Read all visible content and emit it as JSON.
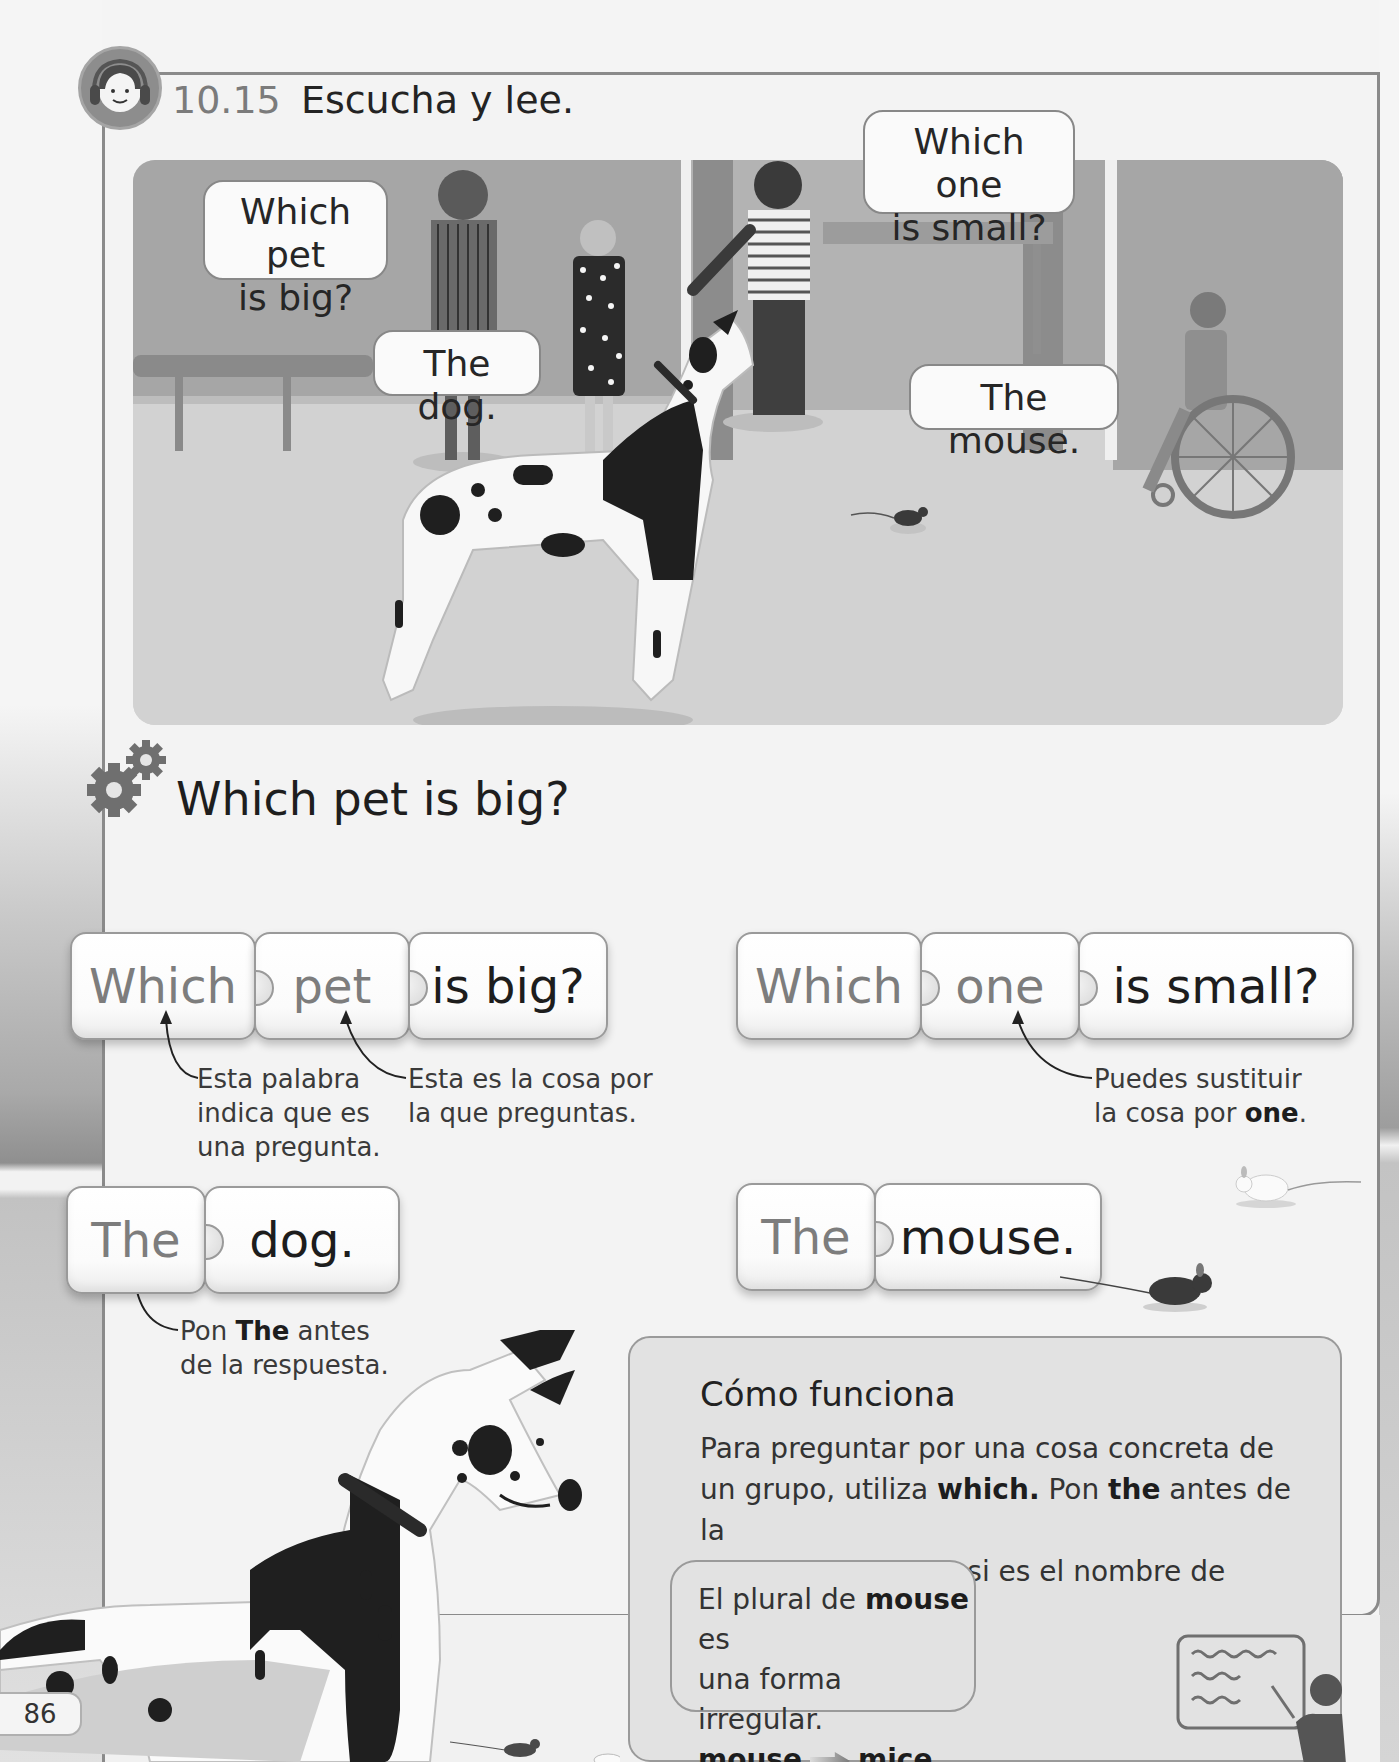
{
  "header": {
    "exercise_number": "10.15",
    "exercise_instruction": "Escucha y lee.",
    "icon": "headphones-icon"
  },
  "scene": {
    "bubbles": [
      {
        "id": "q1",
        "text_line1": "Which pet",
        "text_line2": "is big?"
      },
      {
        "id": "a1",
        "text_line1": "The dog."
      },
      {
        "id": "q2",
        "text_line1": "Which one",
        "text_line2": "is small?"
      },
      {
        "id": "a2",
        "text_line1": "The mouse."
      }
    ]
  },
  "grammar": {
    "title": "Which pet is big?",
    "icon": "gears-icon",
    "question_1": {
      "tiles": [
        "Which",
        "pet",
        "is big?"
      ]
    },
    "question_2": {
      "tiles": [
        "Which",
        "one",
        "is small?"
      ]
    },
    "answer_1": {
      "tiles": [
        "The",
        "dog."
      ]
    },
    "answer_2": {
      "tiles": [
        "The",
        "mouse."
      ]
    },
    "notes": {
      "which_line1": "Esta palabra",
      "which_line2": "indica que es",
      "which_line3": "una pregunta.",
      "pet_line1": "Esta es la cosa por",
      "pet_line2": "la que preguntas.",
      "one_line1": "Puedes sustituir",
      "one_line2_pre": "la cosa por ",
      "one_line2_bold": "one",
      "one_line2_post": ".",
      "the_line1_pre": "Pon ",
      "the_line1_bold": "The",
      "the_line1_post": " antes",
      "the_line2": "de la respuesta."
    }
  },
  "info_box": {
    "title": "Cómo funciona",
    "line1": "Para preguntar por una cosa concreta de",
    "line2_pre": "un grupo, utiliza ",
    "line2_bold1": "which.",
    "line2_mid": " Pon ",
    "line2_bold2": "the",
    "line2_post": " antes de la",
    "line3": "respuesta excepto si es el nombre de alguien.",
    "plural": {
      "line1_pre": "El plural de ",
      "line1_bold": "mouse",
      "line1_post": " es",
      "line2": "una forma irregular.",
      "singular": "mouse",
      "plural_form": "mice"
    }
  },
  "footer": {
    "page_number": "86"
  },
  "colors": {
    "frame": "#8a8a8a",
    "scene_wall": "#a7a7a7",
    "scene_floor": "#d0d0d0",
    "tile_grey_text": "#7d7d7d",
    "tile_dark_text": "#1d1d1d"
  }
}
